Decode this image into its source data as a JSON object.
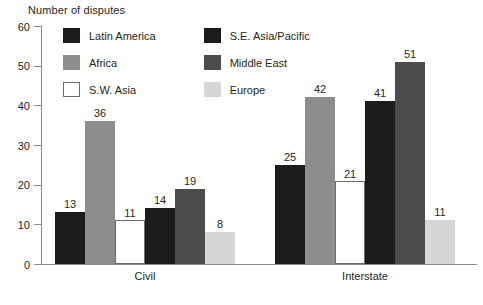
{
  "chart_data": {
    "type": "bar",
    "title": "Number of disputes",
    "xlabel": "",
    "ylabel": "Number of disputes",
    "ylim": [
      0,
      60
    ],
    "ytick_step": 10,
    "yticks": [
      0,
      10,
      20,
      30,
      40,
      50,
      60
    ],
    "grid": false,
    "legend_position": "top-left-inside",
    "categories": [
      "Civil",
      "Interstate"
    ],
    "series": [
      {
        "name": "Latin America",
        "color": "#1c1c1c",
        "values": [
          13,
          25
        ]
      },
      {
        "name": "Africa",
        "color": "#8d8d8d",
        "values": [
          36,
          42
        ]
      },
      {
        "name": "S.W. Asia",
        "color": "#ffffff",
        "values": [
          11,
          21
        ]
      },
      {
        "name": "S.E. Asia/Pacific",
        "color": "#1c1c1c",
        "values": [
          14,
          41
        ]
      },
      {
        "name": "Middle East",
        "color": "#4c4c4c",
        "values": [
          19,
          51
        ]
      },
      {
        "name": "Europe",
        "color": "#d6d6d6",
        "values": [
          8,
          11
        ]
      }
    ]
  },
  "axis": {
    "title": "Number of disputes",
    "ticks": [
      "60",
      "50",
      "40",
      "30",
      "20",
      "10",
      "0"
    ]
  },
  "legend": {
    "items": [
      {
        "label": "Latin America"
      },
      {
        "label": "S.E. Asia/Pacific"
      },
      {
        "label": "Africa"
      },
      {
        "label": "Middle East"
      },
      {
        "label": "S.W. Asia"
      },
      {
        "label": "Europe"
      }
    ]
  },
  "groups": [
    {
      "label": "Civil",
      "bars": [
        {
          "series": "Latin America",
          "value": "13"
        },
        {
          "series": "Africa",
          "value": "36"
        },
        {
          "series": "S.W. Asia",
          "value": "11"
        },
        {
          "series": "S.E. Asia/Pacific",
          "value": "14"
        },
        {
          "series": "Middle East",
          "value": "19"
        },
        {
          "series": "Europe",
          "value": "8"
        }
      ]
    },
    {
      "label": "Interstate",
      "bars": [
        {
          "series": "Latin America",
          "value": "25"
        },
        {
          "series": "Africa",
          "value": "42"
        },
        {
          "series": "S.W. Asia",
          "value": "21"
        },
        {
          "series": "S.E. Asia/Pacific",
          "value": "41"
        },
        {
          "series": "Middle East",
          "value": "51"
        },
        {
          "series": "Europe",
          "value": "11"
        }
      ]
    }
  ]
}
